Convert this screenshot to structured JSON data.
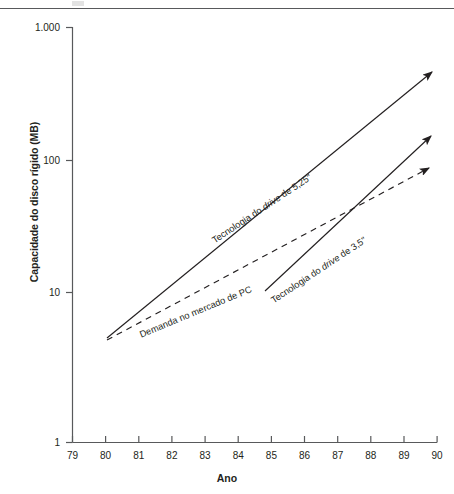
{
  "figure": {
    "background_color": "#ffffff",
    "line_color": "#231f20",
    "axis_color": "#58595b",
    "has_top_rule": true
  },
  "chart_data": {
    "type": "line",
    "title": "",
    "subtitle": "",
    "xlabel": "Ano",
    "ylabel": "Capacidade do disco rígido (MB)",
    "xlim": [
      79,
      90
    ],
    "ylim": [
      1,
      1000
    ],
    "yscale": "log",
    "xscale": "linear",
    "grid": false,
    "legend": "inline-annotations",
    "xticks": [
      79,
      80,
      81,
      82,
      83,
      84,
      85,
      86,
      87,
      88,
      89,
      90
    ],
    "xtick_labels": [
      "79",
      "80",
      "81",
      "82",
      "83",
      "84",
      "85",
      "86",
      "87",
      "88",
      "89",
      "90"
    ],
    "yticks": [
      1,
      10,
      100,
      1000
    ],
    "ytick_labels": [
      "1",
      "10",
      "100",
      "1.000"
    ],
    "series": [
      {
        "name": "Tecnologia do drive de 5,25\"",
        "label_html": "Tecnologia do <i>drive</i> de 5,25\"",
        "style": "solid",
        "arrow": true,
        "x": [
          80.05,
          90.1
        ],
        "y": [
          5.1,
          420
        ],
        "label_angle_deg": -33.5
      },
      {
        "name": "Demanda no mercado de PC",
        "label_html": "Demanda no mercado de PC",
        "style": "dashed",
        "arrow": true,
        "x": [
          80.05,
          90.1
        ],
        "y": [
          5.1,
          95
        ],
        "label_angle_deg": -22.5
      },
      {
        "name": "Tecnologia do drive de 3,5\"",
        "label_html": "Tecnologia do <i>drive</i> de 3,5\"",
        "style": "solid",
        "arrow": true,
        "x": [
          84.85,
          90.1
        ],
        "y": [
          13.3,
          165
        ],
        "label_angle_deg": -33.5
      }
    ],
    "annotations": [
      {
        "text": "Tecnologia do drive de 5,25\"",
        "attached_to": "Tecnologia do drive de 5,25\"",
        "position": {
          "x_px": 213,
          "y_px": 236
        },
        "rotation_deg": -33.5
      },
      {
        "text": "Demanda no mercado de PC",
        "attached_to": "Demanda no mercado de PC",
        "position": {
          "x_px": 140,
          "y_px": 330
        },
        "rotation_deg": -22.5
      },
      {
        "text": "Tecnologia do drive de 3,5\"",
        "attached_to": "Tecnologia do drive de 3,5\"",
        "position": {
          "x_px": 272,
          "y_px": 296
        },
        "rotation_deg": -33.5
      }
    ]
  }
}
